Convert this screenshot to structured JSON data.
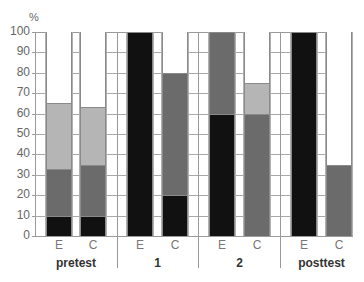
{
  "chart_data": {
    "type": "bar",
    "stacked": true,
    "title": "",
    "xlabel": "",
    "ylabel": "%",
    "ylim": [
      0,
      100
    ],
    "yticks": [
      0,
      10,
      20,
      30,
      40,
      50,
      60,
      70,
      80,
      90,
      100
    ],
    "grid": true,
    "legend": null,
    "groups": [
      "pretest",
      "1",
      "2",
      "posttest"
    ],
    "subcategories": [
      "E",
      "C"
    ],
    "categories": [
      "pretest E",
      "pretest C",
      "1 E",
      "1 C",
      "2 E",
      "2 C",
      "posttest E",
      "posttest C"
    ],
    "series": [
      {
        "name": "black",
        "color": "#111111",
        "values": [
          10,
          10,
          100,
          20,
          60,
          0,
          100,
          0
        ]
      },
      {
        "name": "dark gray",
        "color": "#6b6b6b",
        "values": [
          23,
          25,
          0,
          60,
          40,
          60,
          0,
          35
        ]
      },
      {
        "name": "light gray",
        "color": "#b5b5b5",
        "values": [
          32,
          28,
          0,
          0,
          0,
          15,
          0,
          0
        ]
      },
      {
        "name": "white",
        "color": "#ffffff",
        "values": [
          35,
          37,
          0,
          20,
          0,
          25,
          0,
          65
        ]
      }
    ]
  },
  "axis": {
    "unit": "%",
    "ticks": [
      "0",
      "10",
      "20",
      "30",
      "40",
      "50",
      "60",
      "70",
      "80",
      "90",
      "100"
    ]
  },
  "groups": [
    {
      "label": "pretest",
      "bars": [
        "E",
        "C"
      ]
    },
    {
      "label": "1",
      "bars": [
        "E",
        "C"
      ]
    },
    {
      "label": "2",
      "bars": [
        "E",
        "C"
      ]
    },
    {
      "label": "posttest",
      "bars": [
        "E",
        "C"
      ]
    }
  ]
}
